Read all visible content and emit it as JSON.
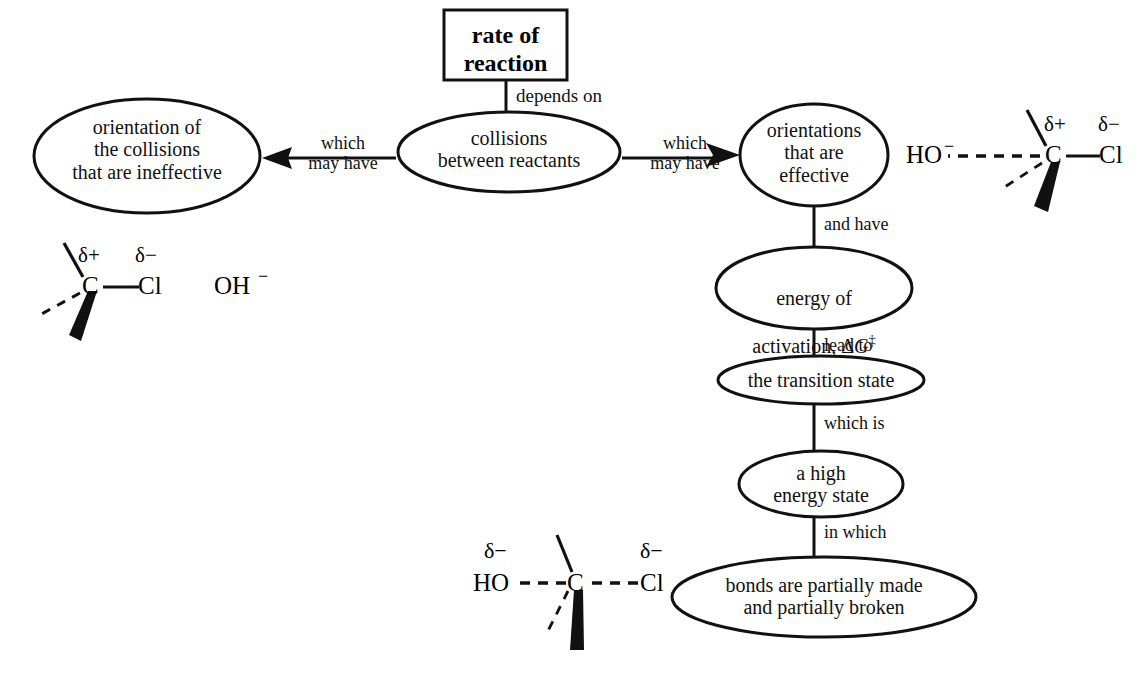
{
  "diagram": {
    "title_box": {
      "label": "rate of\nreaction"
    },
    "nodes": [
      {
        "id": "collisions",
        "label": "collisions\nbetween reactants"
      },
      {
        "id": "ineffective",
        "label": "orientation of\nthe collisions\nthat are ineffective"
      },
      {
        "id": "effective",
        "label": "orientations\nthat are\neffective"
      },
      {
        "id": "activation",
        "label_line1": "energy of",
        "label_line2_pre": "activation, Δ",
        "label_italic": "G",
        "label_dagger": "‡"
      },
      {
        "id": "transition-state",
        "label": "the transition state"
      },
      {
        "id": "high-energy",
        "label": "a high\nenergy state"
      },
      {
        "id": "bonds",
        "label": "bonds are partially made\nand partially broken"
      }
    ],
    "links": [
      {
        "id": "depends-on",
        "label": "depends on"
      },
      {
        "id": "which-may-have-left",
        "label": "which\nmay have"
      },
      {
        "id": "which-may-have-right",
        "label": "which\nmay have"
      },
      {
        "id": "and-have",
        "label": "and have"
      },
      {
        "id": "lead-to",
        "label": "lead to"
      },
      {
        "id": "which-is",
        "label": "which is"
      },
      {
        "id": "in-which",
        "label": "in which"
      }
    ],
    "molecules": [
      {
        "id": "ineffective-molecule",
        "atoms": {
          "carbon": "C",
          "chlorine": "Cl",
          "hydroxide": "OH"
        },
        "charges": {
          "carbon": "δ+",
          "chlorine": "δ−",
          "hydroxide": "−"
        }
      },
      {
        "id": "effective-molecule",
        "atoms": {
          "carbon": "C",
          "chlorine": "Cl",
          "hydroxide": "HO"
        },
        "charges": {
          "carbon": "δ+",
          "chlorine": "δ−",
          "hydroxide": "−"
        }
      },
      {
        "id": "transition-state-molecule",
        "atoms": {
          "carbon": "C",
          "chlorine": "Cl",
          "hydroxide": "HO"
        },
        "charges": {
          "chlorine": "δ−",
          "hydroxide": "δ−"
        }
      }
    ],
    "colors": {
      "background": "#ffffff",
      "stroke": "#111111",
      "text": "#111111"
    }
  }
}
